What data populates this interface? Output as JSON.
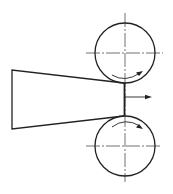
{
  "diagram": {
    "colors": {
      "line": "#222222",
      "background": "#ffffff"
    },
    "rollers": [
      {
        "name": "top-roller",
        "cx": 125,
        "cy": 53,
        "r": 30,
        "rotation": "clockwise"
      },
      {
        "name": "bottom-roller",
        "cx": 125,
        "cy": 146,
        "r": 30,
        "rotation": "counter-clockwise"
      }
    ],
    "workpiece": {
      "shape": "trapezoid",
      "points": "12,70 124,83 124,116 12,129"
    },
    "exit_arrow": {
      "x1": 125,
      "y1": 97,
      "x2": 152,
      "y2": 97
    },
    "labels": []
  }
}
